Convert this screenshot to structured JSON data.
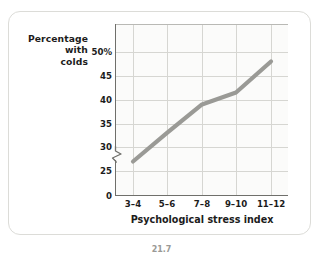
{
  "figure": {
    "caption": "21.7"
  },
  "chart_data": {
    "type": "line",
    "title": "",
    "subtitle": "",
    "xlabel": "Psychological stress index",
    "ylabel": "Percentage with colds",
    "ylabel_lines": [
      "Percentage",
      "with",
      "colds"
    ],
    "categories": [
      "3–4",
      "5–6",
      "7–8",
      "9–10",
      "11–12"
    ],
    "values": [
      27,
      33,
      39,
      41.5,
      48
    ],
    "series": [
      {
        "name": "Percentage with colds",
        "values": [
          27,
          33,
          39,
          41.5,
          48
        ],
        "color": "#9a9a96"
      }
    ],
    "ytick_labels": [
      "50%",
      "45",
      "40",
      "35",
      "30",
      "25",
      "0"
    ],
    "ytick_values": [
      50,
      45,
      40,
      35,
      30,
      25,
      0
    ],
    "ylim": [
      25,
      52
    ],
    "y_axis_break": true,
    "y_axis_break_below": 25,
    "xtick_labels": [
      "3–4",
      "5–6",
      "7–8",
      "9–10",
      "11–12"
    ],
    "grid": true,
    "legend": "none",
    "line_color": "#9a9a96",
    "grid_color": "#d6d6d2",
    "axis_color": "#6f6f6b",
    "plot_bg": "#fbfbfa",
    "panel_border": "#dcdcd8"
  }
}
